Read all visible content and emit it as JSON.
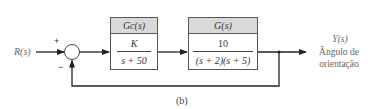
{
  "diagram": {
    "type": "feedback-control-block-diagram",
    "caption": "(b)",
    "input": {
      "label": "R(s)"
    },
    "summing_junction": {
      "plus_sign": "+",
      "minus_sign": "−"
    },
    "blocks": [
      {
        "id": "controller",
        "header": "Gc(s)",
        "numerator": "K",
        "denominator": "s + 50"
      },
      {
        "id": "plant",
        "header": "G(s)",
        "numerator": "10",
        "denominator": "(s + 2)(s + 5)"
      }
    ],
    "output": {
      "label": "Y(s)",
      "description_line1": "Ângulo de",
      "description_line2": "orientação"
    },
    "feedback": {
      "type": "unity",
      "sign": "negative"
    }
  },
  "colors": {
    "line": "#222222",
    "block_header_bg": "#d9d9d9",
    "text": "#333333",
    "side_text": "#666666"
  }
}
